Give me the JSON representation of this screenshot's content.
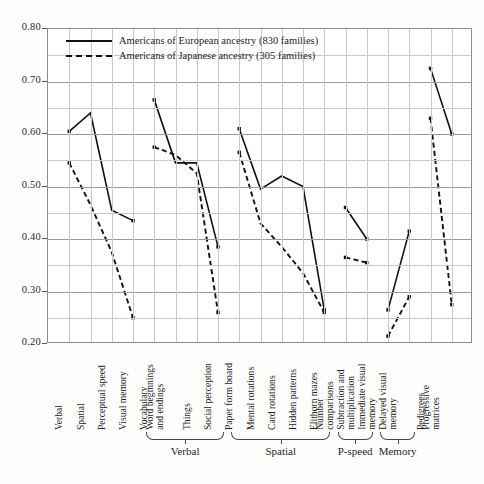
{
  "chart_data": {
    "type": "line",
    "title": "",
    "xlabel": "",
    "ylabel": "",
    "ylim": [
      0.2,
      0.8
    ],
    "ytick_labels": [
      "0.80",
      "0.70",
      "0.60",
      "0.50",
      "0.40",
      "0.30",
      "0.20"
    ],
    "ytick_values": [
      0.8,
      0.7,
      0.6,
      0.5,
      0.4,
      0.3,
      0.2
    ],
    "y_minor_step": 0.05,
    "grid": true,
    "legend_position": "top-left",
    "categories": [
      "Verbal",
      "Spatial",
      "Perceptual speed",
      "Visual memory",
      "Vocabulary",
      "Word beginnings and endings",
      "Things",
      "Social perception",
      "Paper form board",
      "Mental rotations",
      "Card rotations",
      "Hidden patterns",
      "Elithorn mazes",
      "Number comparisons",
      "Subtraction and multiplication",
      "Immediate visual memory",
      "Delayed visual memory",
      "Pedigrees",
      "Progressive matrices"
    ],
    "series": [
      {
        "name": "Americans of European ancestry (830 families)",
        "style": "solid",
        "color": "#111111",
        "values": [
          0.605,
          0.64,
          0.455,
          0.435,
          0.665,
          0.545,
          0.545,
          0.385,
          0.61,
          0.495,
          0.52,
          0.5,
          0.265,
          0.46,
          0.4,
          0.265,
          0.415,
          0.725,
          0.6
        ]
      },
      {
        "name": "Americans of Japanese ancestry (305 families)",
        "style": "dashed",
        "color": "#111111",
        "values": [
          0.545,
          0.465,
          0.375,
          0.25,
          0.575,
          0.56,
          0.525,
          0.26,
          0.565,
          0.43,
          0.385,
          0.335,
          0.26,
          0.365,
          0.355,
          0.215,
          0.29,
          0.63,
          0.275
        ]
      }
    ],
    "segments": [
      {
        "start": 0,
        "end": 3
      },
      {
        "start": 4,
        "end": 7
      },
      {
        "start": 8,
        "end": 12
      },
      {
        "start": 13,
        "end": 14
      },
      {
        "start": 15,
        "end": 16
      },
      {
        "start": 17,
        "end": 18
      }
    ],
    "groups": [
      {
        "label": "Verbal",
        "from": 4,
        "to": 7
      },
      {
        "label": "Spatial",
        "from": 8,
        "to": 12
      },
      {
        "label": "P-speed",
        "from": 13,
        "to": 14
      },
      {
        "label": "Memory",
        "from": 15,
        "to": 16
      }
    ]
  },
  "legend": {
    "items": [
      {
        "label": "Americans of European ancestry (830 families)",
        "style": "solid"
      },
      {
        "label": "Americans of Japanese ancestry (305 families)",
        "style": "dashed"
      }
    ]
  }
}
